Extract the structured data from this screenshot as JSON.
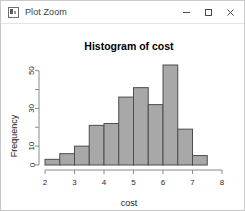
{
  "window": {
    "title": "Plot Zoom",
    "icon": "plot-window-icon",
    "buttons": {
      "minimize": "minimize-icon",
      "maximize": "maximize-icon",
      "close": "close-icon"
    }
  },
  "colors": {
    "bar_fill": "#a8a8a8",
    "bar_stroke": "#4d4d4d",
    "axis": "#8a8a8a",
    "text": "#1a1a1a",
    "window_border": "#c9c9c9"
  },
  "chart_data": {
    "type": "bar",
    "title": "Histogram of cost",
    "xlabel": "cost",
    "ylabel": "Frequency",
    "grid": false,
    "legend": null,
    "xlim": [
      2,
      8
    ],
    "ylim": [
      0,
      53
    ],
    "xticks": [
      2,
      3,
      4,
      5,
      6,
      7,
      8
    ],
    "xticklabels": [
      "2",
      "3",
      "4",
      "5",
      "6",
      "7",
      "8"
    ],
    "yticks": [
      0,
      10,
      20,
      30,
      40,
      50
    ],
    "yticklabels": [
      "0",
      "10",
      "",
      "30",
      "",
      "50"
    ],
    "bin_width": 0.5,
    "bin_edges": [
      2.0,
      2.5,
      3.0,
      3.5,
      4.0,
      4.5,
      5.0,
      5.5,
      6.0,
      6.5,
      7.0,
      7.5
    ],
    "categories": [
      "2.0-2.5",
      "2.5-3.0",
      "3.0-3.5",
      "3.5-4.0",
      "4.0-4.5",
      "4.5-5.0",
      "5.0-5.5",
      "5.5-6.0",
      "6.0-6.5",
      "6.5-7.0",
      "7.0-7.5"
    ],
    "values": [
      3,
      6,
      10,
      21,
      22,
      36,
      41,
      32,
      53,
      19,
      5
    ]
  }
}
